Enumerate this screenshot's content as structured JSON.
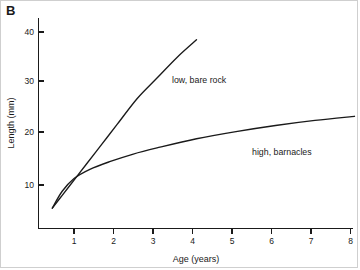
{
  "figure": {
    "panel_label": "B"
  },
  "chart_data": {
    "type": "line",
    "title": "",
    "subtitle": "",
    "xlabel": "Age (years)",
    "ylabel": "Length (mm)",
    "xlim": [
      0,
      8
    ],
    "ylim": [
      0,
      44
    ],
    "xticks": [
      1,
      2,
      3,
      4,
      5,
      6,
      7,
      8
    ],
    "xtick_labels": [
      "1",
      "2",
      "3",
      "4",
      "5",
      "6",
      "7",
      "8"
    ],
    "yticks": [
      10,
      20,
      30,
      40
    ],
    "ytick_labels": [
      "10",
      "20",
      "30",
      "40"
    ],
    "grid": false,
    "legend_position": "inline-annotation",
    "series": [
      {
        "name": "low, bare rock",
        "annotation": "low, bare rock",
        "annotation_x": 2.9,
        "annotation_y": 28.5,
        "color": "#1a1a1a",
        "x": [
          0.35,
          0.6,
          0.9,
          1.2,
          1.6,
          2.0,
          2.5,
          3.0,
          3.5,
          4.0
        ],
        "y": [
          4.0,
          6.5,
          9.5,
          12.5,
          16.5,
          20.5,
          25.5,
          29.5,
          33.5,
          37.0
        ]
      },
      {
        "name": "high, barnacles",
        "annotation": "high, barnacles",
        "annotation_x": 5.4,
        "annotation_y": 16.0,
        "color": "#1a1a1a",
        "x": [
          0.35,
          0.6,
          0.9,
          1.3,
          1.8,
          2.4,
          3.0,
          4.0,
          5.0,
          6.0,
          7.0,
          8.0
        ],
        "y": [
          4.0,
          7.3,
          9.8,
          11.6,
          13.1,
          14.6,
          15.8,
          17.6,
          19.0,
          20.2,
          21.2,
          22.0
        ]
      }
    ]
  }
}
